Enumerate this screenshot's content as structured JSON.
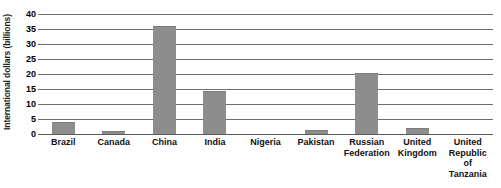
{
  "chart_data": {
    "type": "bar",
    "title": "",
    "xlabel": "",
    "ylabel": "International dollars (billions)",
    "ylim": [
      0,
      40
    ],
    "yticks": [
      40,
      35,
      30,
      25,
      20,
      15,
      10,
      5,
      0
    ],
    "ytick_labels": [
      "40",
      "35",
      "30",
      "25",
      "20",
      "15",
      "10",
      "5",
      "0"
    ],
    "grid": "horizontal",
    "legend": "none",
    "bar_color": "#8d8d8d",
    "gridline_color": "#6f6f6f",
    "categories": [
      "Brazil",
      "Canada",
      "China",
      "India",
      "Nigeria",
      "Pakistan",
      "Russian Federation",
      "United Kingdom",
      "United Republic of Tanzania"
    ],
    "values": [
      4,
      1,
      36,
      14.5,
      0,
      1.5,
      20.5,
      2,
      0
    ]
  },
  "ghost_title": "",
  "axis": {
    "y_title": "International dollars (billions)"
  }
}
